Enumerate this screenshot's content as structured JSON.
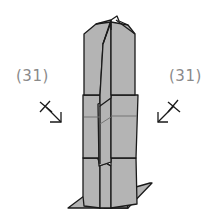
{
  "diagram": {
    "type": "origami-fold-diagram",
    "colors": {
      "paper_fill": "#b4b4b4",
      "outline": "#1a1a1a",
      "crease": "#6e6e6e",
      "label": "#8a8a8a",
      "background": "#ffffff"
    },
    "annotations": {
      "left": {
        "label": "(31)",
        "arrow": "arrow-down-right",
        "symbol": "x-mark"
      },
      "right": {
        "label": "(31)",
        "arrow": "arrow-down-left",
        "symbol": "x-mark"
      }
    }
  }
}
